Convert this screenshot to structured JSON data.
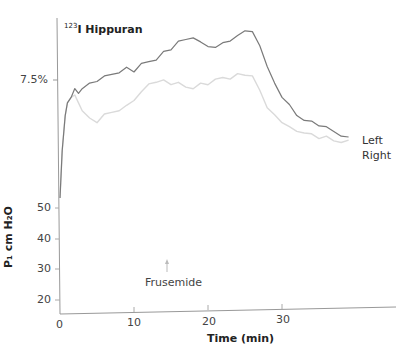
{
  "chart_data": {
    "type": "line",
    "title": "123I Hippuran",
    "title_superscript": "123",
    "title_main": "I Hippuran",
    "xlabel": "Time (min)",
    "ylabel_lower": "P1 cm H2O",
    "x_ticks": [
      "0",
      "10",
      "20",
      "30"
    ],
    "y_ticks_lower": [
      "20",
      "30",
      "40",
      "50"
    ],
    "y_tick_upper": "7.5%",
    "xlim": [
      0,
      40
    ],
    "grid": false,
    "legend_position": "right, inline at line ends",
    "annotations": [
      {
        "text": "Frusemide",
        "x": 14.5,
        "marker": "arrow pointing up"
      }
    ],
    "series": [
      {
        "name": "Left",
        "color": "#777777",
        "x": [
          0,
          0.3,
          0.7,
          1,
          1.5,
          2,
          2.5,
          3,
          4,
          5,
          6,
          7,
          8,
          9,
          10,
          11,
          12,
          13,
          14,
          15,
          16,
          17,
          18,
          19,
          20,
          21,
          22,
          23,
          24,
          25,
          26,
          27,
          28,
          29,
          30,
          31,
          32,
          33,
          34,
          35,
          36,
          37,
          38,
          39
        ],
        "values": [
          0.4,
          0.55,
          0.66,
          0.7,
          0.72,
          0.74,
          0.73,
          0.75,
          0.76,
          0.77,
          0.78,
          0.79,
          0.8,
          0.81,
          0.8,
          0.82,
          0.83,
          0.84,
          0.86,
          0.87,
          0.89,
          0.9,
          0.91,
          0.89,
          0.88,
          0.87,
          0.89,
          0.9,
          0.91,
          0.93,
          0.92,
          0.88,
          0.82,
          0.76,
          0.72,
          0.69,
          0.66,
          0.65,
          0.64,
          0.63,
          0.62,
          0.61,
          0.6,
          0.59
        ]
      },
      {
        "name": "Right",
        "color": "#d8d8d8",
        "x": [
          0,
          0.3,
          0.7,
          1,
          1.5,
          2,
          2.5,
          3,
          4,
          5,
          6,
          7,
          8,
          9,
          10,
          11,
          12,
          13,
          14,
          15,
          16,
          17,
          18,
          19,
          20,
          21,
          22,
          23,
          24,
          25,
          26,
          27,
          28,
          29,
          30,
          31,
          32,
          33,
          34,
          35,
          36,
          37,
          38,
          39
        ],
        "values": [
          0.4,
          0.55,
          0.66,
          0.7,
          0.72,
          0.72,
          0.7,
          0.68,
          0.65,
          0.64,
          0.66,
          0.67,
          0.68,
          0.69,
          0.71,
          0.73,
          0.76,
          0.77,
          0.77,
          0.76,
          0.76,
          0.75,
          0.75,
          0.76,
          0.76,
          0.77,
          0.78,
          0.78,
          0.79,
          0.79,
          0.78,
          0.74,
          0.69,
          0.66,
          0.64,
          0.62,
          0.61,
          0.61,
          0.6,
          0.59,
          0.59,
          0.58,
          0.58,
          0.58
        ]
      }
    ]
  },
  "labels": {
    "title_sup": "123",
    "title_main": "I Hippuran",
    "ylabel": "P₁ cm H₂O",
    "xlabel": "Time (min)",
    "y_upper_tick": "7.5%",
    "y_ticks": [
      "50",
      "40",
      "30",
      "20"
    ],
    "x_ticks": [
      "0",
      "10",
      "20",
      "30"
    ],
    "legend_left": "Left",
    "legend_right": "Right",
    "annotation": "Frusemide"
  }
}
